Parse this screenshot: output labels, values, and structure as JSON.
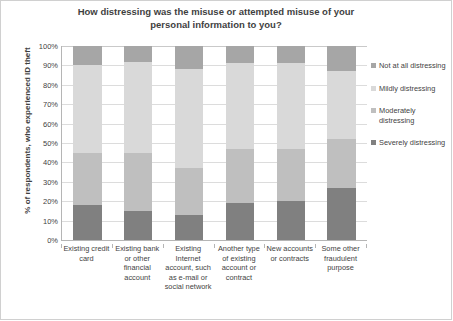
{
  "chart_data": {
    "type": "bar",
    "subtype": "stacked-percent-column",
    "title": "How distressing was the misuse or attempted misuse of your personal information to you?",
    "xlabel": "",
    "ylabel": "% of respondents, who experienced ID theft",
    "ylim": [
      0,
      100
    ],
    "ytick_labels": [
      "100%",
      "90%",
      "80%",
      "70%",
      "60%",
      "50%",
      "40%",
      "30%",
      "20%",
      "10%",
      "0%"
    ],
    "ytick_values": [
      100,
      90,
      80,
      70,
      60,
      50,
      40,
      30,
      20,
      10,
      0
    ],
    "grid": true,
    "legend_position": "right",
    "categories": [
      "Existing credit card",
      "Existing bank or other financial account",
      "Existing Internet account, such as e-mail or social network",
      "Another type of existing account or contract",
      "New accounts or contracts",
      "Some other fraudulent purpose"
    ],
    "series": [
      {
        "name": "Severely distressing",
        "color": "#808080",
        "values": [
          18,
          15,
          13,
          19,
          20,
          27
        ]
      },
      {
        "name": "Moderately distressing",
        "color": "#bfbfbf",
        "values": [
          27,
          30,
          24,
          28,
          27,
          25
        ]
      },
      {
        "name": "Mildly distressing",
        "color": "#d9d9d9",
        "values": [
          45,
          47,
          51,
          44,
          44,
          35
        ]
      },
      {
        "name": "Not at all distressing",
        "color": "#a6a6a6",
        "values": [
          10,
          8,
          12,
          9,
          9,
          13
        ]
      }
    ],
    "stack_order_bottom_to_top": [
      "Severely distressing",
      "Moderately distressing",
      "Mildly distressing",
      "Not at all distressing"
    ]
  },
  "legend": {
    "items": [
      {
        "label": "Not at all distressing",
        "color": "#a6a6a6"
      },
      {
        "label": "Mildly distressing",
        "color": "#d9d9d9"
      },
      {
        "label": "Moderately distressing",
        "color": "#bfbfbf"
      },
      {
        "label": "Severely distressing",
        "color": "#808080"
      }
    ]
  },
  "colors": {
    "text": "#3f3f3f",
    "gridline": "#dcdcdc",
    "axis": "#b5b5b5",
    "frame": "#d0d0d0",
    "background": "#ffffff"
  }
}
